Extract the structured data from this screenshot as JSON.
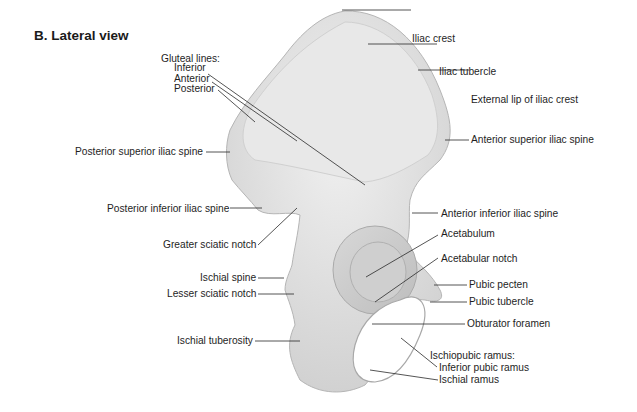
{
  "figure": {
    "title": "B. Lateral view"
  },
  "labels": {
    "gluteal_lines_heading": "Gluteal lines:",
    "gluteal_inferior": "Inferior",
    "gluteal_anterior": "Anterior",
    "gluteal_posterior": "Posterior",
    "iliac_crest": "Iliac crest",
    "iliac_tubercle": "Iliac tubercle",
    "external_lip": "External lip of iliac crest",
    "asis": "Anterior superior iliac spine",
    "psis": "Posterior superior iliac spine",
    "piis": "Posterior inferior iliac spine",
    "greater_sciatic_notch": "Greater sciatic notch",
    "aiis": "Anterior inferior iliac spine",
    "acetabulum": "Acetabulum",
    "acetabular_notch": "Acetabular notch",
    "ischial_spine": "Ischial spine",
    "lesser_sciatic_notch": "Lesser sciatic notch",
    "pubic_pecten": "Pubic pecten",
    "pubic_tubercle": "Pubic tubercle",
    "obturator_foramen": "Obturator foramen",
    "ischial_tuberosity": "Ischial tuberosity",
    "ischiopubic_ramus_heading": "Ischiopubic ramus:",
    "inferior_pubic_ramus": "Inferior pubic ramus",
    "ischial_ramus": "Ischial ramus"
  },
  "colors": {
    "bone_fill": "#e4e4e4",
    "bone_shade": "#c9c9c9",
    "leader_line": "#2a2a2a",
    "text": "#1e1e1e"
  }
}
